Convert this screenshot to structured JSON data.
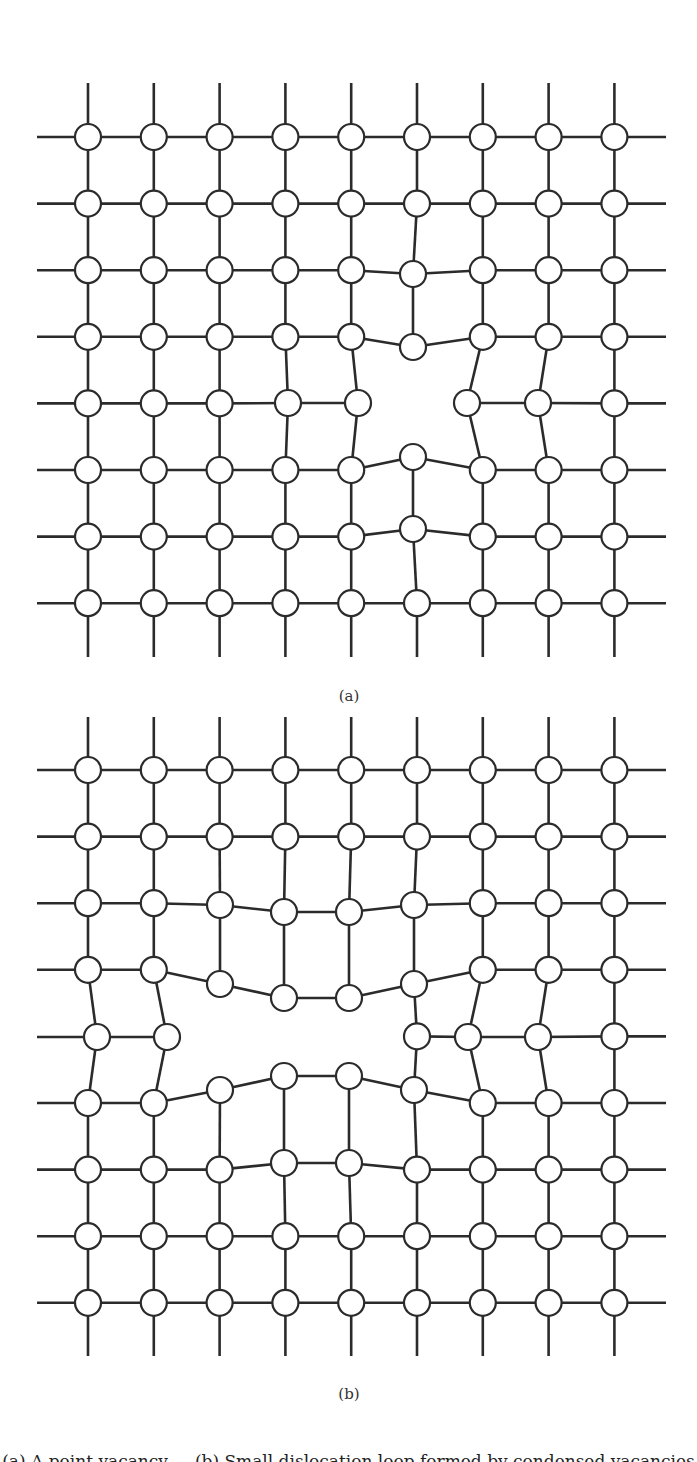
{
  "figure": {
    "node_radius": 13,
    "stroke_color": "#2b2b2b",
    "node_fill": "#ffffff",
    "panels": [
      {
        "id": "a",
        "label": "(a)",
        "label_pos": [
          349,
          697
        ],
        "cols": 9,
        "rows": 8,
        "x0": 88,
        "dx": 65.8,
        "y0": 137,
        "dy": 66.6,
        "line_left": 37,
        "line_right": 666,
        "stub_top": 83,
        "stub_bottom": 657,
        "missing": [
          [
            4,
            5
          ]
        ],
        "moved": {
          "2,5": [
            413,
            274
          ],
          "3,5": [
            413,
            347
          ],
          "4,3": [
            288,
            403
          ],
          "4,4": [
            358,
            403
          ],
          "4,6": [
            467,
            403
          ],
          "4,7": [
            538,
            403
          ],
          "5,5": [
            413,
            457
          ],
          "6,5": [
            413,
            529
          ]
        }
      },
      {
        "id": "b",
        "label": "(b)",
        "label_pos": [
          349,
          1395
        ],
        "cols": 9,
        "rows": 9,
        "x0": 88,
        "dx": 65.8,
        "y0": 770,
        "dy": 66.6,
        "line_left": 37,
        "line_right": 666,
        "stub_top": 717,
        "stub_bottom": 1356,
        "missing": [
          [
            4,
            2
          ],
          [
            4,
            3
          ],
          [
            4,
            4
          ]
        ],
        "moved": {
          "2,2": [
            220,
            905
          ],
          "2,3": [
            284,
            912
          ],
          "2,4": [
            349,
            912
          ],
          "2,5": [
            414,
            905
          ],
          "3,2": [
            220,
            984
          ],
          "3,3": [
            284,
            998
          ],
          "3,4": [
            349,
            998
          ],
          "3,5": [
            414,
            984
          ],
          "4,0": [
            97,
            1037
          ],
          "4,1": [
            167,
            1037
          ],
          "4,6": [
            468,
            1037
          ],
          "4,7": [
            538,
            1037
          ],
          "5,2": [
            220,
            1090
          ],
          "5,3": [
            284,
            1076
          ],
          "5,4": [
            349,
            1076
          ],
          "5,5": [
            414,
            1090
          ],
          "6,3": [
            284,
            1163
          ],
          "6,4": [
            349,
            1163
          ]
        }
      }
    ],
    "caption": "(a) A point vacancy ... (b) Small dislocation loop formed by condensed vacancies"
  }
}
